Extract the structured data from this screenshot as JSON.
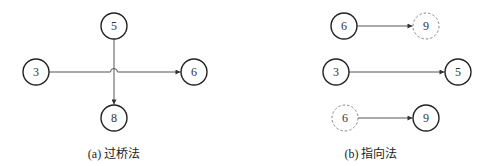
{
  "diagram_a": {
    "caption": "(a) 过桥法",
    "nodes": [
      {
        "id": "a3",
        "label": "3",
        "style": "solid",
        "cx": 36,
        "cy": 72
      },
      {
        "id": "a5",
        "label": "5",
        "style": "solid",
        "cx": 114,
        "cy": 26
      },
      {
        "id": "a6",
        "label": "6",
        "style": "solid",
        "cx": 194,
        "cy": 72
      },
      {
        "id": "a8",
        "label": "8",
        "style": "solid",
        "cx": 114,
        "cy": 118
      }
    ],
    "edges": [
      {
        "from": "3",
        "to": "6",
        "bridge_over": "5→8"
      },
      {
        "from": "5",
        "to": "8"
      }
    ]
  },
  "diagram_b": {
    "caption": "(b) 指向法",
    "nodes": [
      {
        "id": "b6a",
        "label": "6",
        "style": "solid",
        "cx": 344,
        "cy": 26
      },
      {
        "id": "b9a",
        "label": "9",
        "style": "dashed",
        "cx": 426,
        "cy": 26
      },
      {
        "id": "b3",
        "label": "3",
        "style": "solid",
        "cx": 336,
        "cy": 72
      },
      {
        "id": "b5",
        "label": "5",
        "style": "solid",
        "cx": 458,
        "cy": 72
      },
      {
        "id": "b6b",
        "label": "6",
        "style": "dashed",
        "cx": 345,
        "cy": 118
      },
      {
        "id": "b9b",
        "label": "9",
        "style": "solid",
        "cx": 426,
        "cy": 118
      }
    ],
    "edges": [
      {
        "from": "6",
        "to": "9 (dashed)"
      },
      {
        "from": "3",
        "to": "5"
      },
      {
        "from": "6 (dashed)",
        "to": "9"
      }
    ]
  },
  "colors": {
    "node_stroke": "#222222",
    "dashed_stroke": "#777777",
    "edge_stroke": "#555555",
    "background": "#ffffff"
  }
}
